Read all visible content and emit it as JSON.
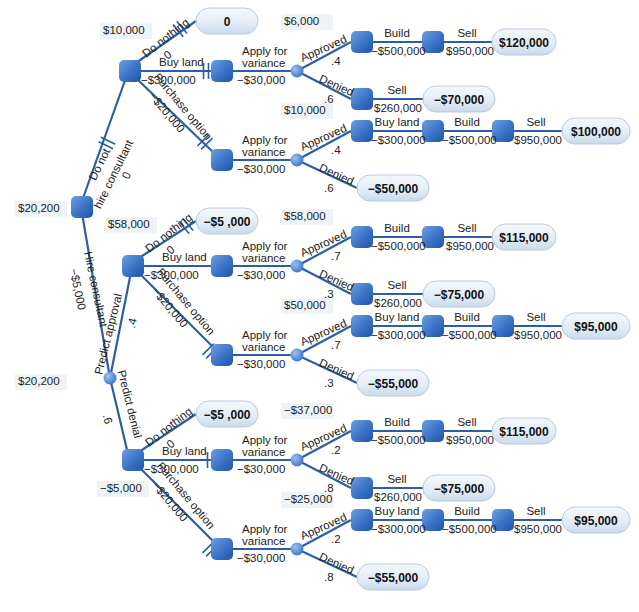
{
  "diagram": {
    "type": "decision-tree",
    "colors": {
      "edge": "#2a5fa8",
      "decision_node": "#3b74c7",
      "chance_node": "#5a8fd6",
      "payoff_fill": "#e4eef8",
      "label_bg": "#eef3f8"
    },
    "root": {
      "ev": "$20,200"
    },
    "branches": {
      "no_consultant": {
        "label1": "Do not",
        "label2": "hire consultant",
        "cost": "0"
      },
      "consultant": {
        "label": "Hire consultant",
        "cost": "−$5,000",
        "chance_ev": "$20,200"
      },
      "predict_approval": {
        "label": "Predict approval",
        "prob": ".4"
      },
      "predict_denial": {
        "label": "Predict denial",
        "prob": ".6"
      }
    },
    "subtrees": [
      {
        "id": "no-consultant",
        "decision_ev": "$10,000",
        "do_nothing": {
          "label": "Do nothing",
          "cost": "0",
          "payoff": "0"
        },
        "buy_land": {
          "label": "Buy land",
          "cost": "−$300,000",
          "ev": "$6,000",
          "apply_l1": "Apply for",
          "apply_l2": "variance",
          "apply_cost": "−$30,000",
          "approved": {
            "label": "Approved",
            "prob": ".4",
            "build": "Build",
            "build_cost": "−$500,000",
            "sell": "Sell",
            "sell_amt": "$950,000",
            "payoff": "$120,000"
          },
          "denied": {
            "label": "Denied",
            "prob": ".6",
            "sell": "Sell",
            "sell_amt": "$260,000",
            "payoff": "−$70,000"
          }
        },
        "option": {
          "label": "Purchase option",
          "cost": "−$20,000",
          "ev": "$10,000",
          "apply_l1": "Apply for",
          "apply_l2": "variance",
          "apply_cost": "−$30,000",
          "approved": {
            "label": "Approved",
            "prob": ".4",
            "buy": "Buy land",
            "buy_cost": "−$300,000",
            "build": "Build",
            "build_cost": "−$500,000",
            "sell": "Sell",
            "sell_amt": "$950,000",
            "payoff": "$100,000"
          },
          "denied": {
            "label": "Denied",
            "prob": ".6",
            "payoff": "−$50,000"
          }
        }
      },
      {
        "id": "predict-approval",
        "decision_ev": "$58,000",
        "do_nothing": {
          "label": "Do nothing",
          "cost": "0",
          "payoff": "−$5 ,000"
        },
        "buy_land": {
          "label": "Buy land",
          "cost": "−$300,000",
          "ev": "$58,000",
          "apply_l1": "Apply for",
          "apply_l2": "variance",
          "apply_cost": "−$30,000",
          "approved": {
            "label": "Approved",
            "prob": ".7",
            "build": "Build",
            "build_cost": "−$500,000",
            "sell": "Sell",
            "sell_amt": "$950,000",
            "payoff": "$115,000"
          },
          "denied": {
            "label": "Denied",
            "prob": ".3",
            "sell": "Sell",
            "sell_amt": "$260,000",
            "payoff": "−$75,000"
          }
        },
        "option": {
          "label": "Purchase option",
          "cost": "−$20,000",
          "ev": "$50,000",
          "apply_l1": "Apply for",
          "apply_l2": "variance",
          "apply_cost": "−$30,000",
          "approved": {
            "label": "Approved",
            "prob": ".7",
            "buy": "Buy land",
            "buy_cost": "−$300,000",
            "build": "Build",
            "build_cost": "−$500,000",
            "sell": "Sell",
            "sell_amt": "$950,000",
            "payoff": "$95,000"
          },
          "denied": {
            "label": "Denied",
            "prob": ".3",
            "payoff": "−$55,000"
          }
        }
      },
      {
        "id": "predict-denial",
        "decision_ev": "−$5,000",
        "do_nothing": {
          "label": "Do nothing",
          "cost": "0",
          "payoff": "−$5 ,000"
        },
        "buy_land": {
          "label": "Buy land",
          "cost": "−$300,000",
          "ev": "−$37,000",
          "apply_l1": "Apply for",
          "apply_l2": "variance",
          "apply_cost": "−$30,000",
          "approved": {
            "label": "Approved",
            "prob": ".2",
            "build": "Build",
            "build_cost": "−$500,000",
            "sell": "Sell",
            "sell_amt": "$950,000",
            "payoff": "$115,000"
          },
          "denied": {
            "label": "Denied",
            "prob": ".8",
            "sell": "Sell",
            "sell_amt": "$260,000",
            "payoff": "−$75,000"
          }
        },
        "option": {
          "label": "Purchase option",
          "cost": "−$20,000",
          "ev": "−$25,000",
          "apply_l1": "Apply for",
          "apply_l2": "variance",
          "apply_cost": "−$30,000",
          "approved": {
            "label": "Approved",
            "prob": ".2",
            "buy": "Buy land",
            "buy_cost": "−$300,000",
            "build": "Build",
            "build_cost": "−$500,000",
            "sell": "Sell",
            "sell_amt": "$950,000",
            "payoff": "$95,000"
          },
          "denied": {
            "label": "Denied",
            "prob": ".8",
            "payoff": "−$55,000"
          }
        }
      }
    ]
  }
}
